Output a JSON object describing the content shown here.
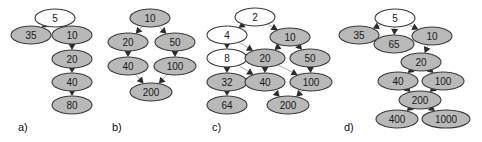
{
  "figure": {
    "width": 482,
    "height": 142,
    "background_color": "#ffffff",
    "node_fill_color": "#b9b9b9",
    "node_empty_color": "#ffffff",
    "node_stroke_color": "#3a3a3a",
    "edge_color": "#b0b0b0",
    "arrow_color": "#2b2b2b"
  },
  "panels": [
    {
      "id": "a",
      "label": "a)",
      "label_x": 18,
      "label_y": 131,
      "nodes": [
        {
          "id": "a5",
          "text": "5",
          "x": 55,
          "y": 18,
          "rx": 20,
          "ry": 9,
          "fill": "empty"
        },
        {
          "id": "a35",
          "text": "35",
          "x": 31,
          "y": 35,
          "rx": 20,
          "ry": 9,
          "fill": "filled"
        },
        {
          "id": "a10",
          "text": "10",
          "x": 72,
          "y": 35,
          "rx": 20,
          "ry": 9,
          "fill": "filled"
        },
        {
          "id": "a20",
          "text": "20",
          "x": 72,
          "y": 59,
          "rx": 20,
          "ry": 9,
          "fill": "filled"
        },
        {
          "id": "a40",
          "text": "40",
          "x": 72,
          "y": 82,
          "rx": 20,
          "ry": 9,
          "fill": "filled"
        },
        {
          "id": "a80",
          "text": "80",
          "x": 72,
          "y": 105,
          "rx": 20,
          "ry": 9,
          "fill": "filled"
        }
      ],
      "edges": [
        {
          "from": "a5",
          "to": "a35"
        },
        {
          "from": "a5",
          "to": "a10"
        },
        {
          "from": "a10",
          "to": "a20"
        },
        {
          "from": "a20",
          "to": "a40"
        },
        {
          "from": "a40",
          "to": "a80"
        }
      ]
    },
    {
      "id": "b",
      "label": "b)",
      "label_x": 112,
      "label_y": 131,
      "nodes": [
        {
          "id": "b10",
          "text": "10",
          "x": 150,
          "y": 18,
          "rx": 20,
          "ry": 9,
          "fill": "filled"
        },
        {
          "id": "b20",
          "text": "20",
          "x": 128,
          "y": 42,
          "rx": 20,
          "ry": 9,
          "fill": "filled"
        },
        {
          "id": "b50",
          "text": "50",
          "x": 175,
          "y": 42,
          "rx": 20,
          "ry": 9,
          "fill": "filled"
        },
        {
          "id": "b40",
          "text": "40",
          "x": 128,
          "y": 66,
          "rx": 20,
          "ry": 9,
          "fill": "filled"
        },
        {
          "id": "b100",
          "text": "100",
          "x": 175,
          "y": 66,
          "rx": 21,
          "ry": 9,
          "fill": "filled"
        },
        {
          "id": "b200",
          "text": "200",
          "x": 151,
          "y": 92,
          "rx": 21,
          "ry": 9,
          "fill": "filled"
        }
      ],
      "edges": [
        {
          "from": "b10",
          "to": "b20"
        },
        {
          "from": "b10",
          "to": "b50"
        },
        {
          "from": "b20",
          "to": "b40"
        },
        {
          "from": "b50",
          "to": "b100"
        },
        {
          "from": "b40",
          "to": "b200"
        },
        {
          "from": "b100",
          "to": "b200"
        }
      ]
    },
    {
      "id": "c",
      "label": "c)",
      "label_x": 212,
      "label_y": 131,
      "nodes": [
        {
          "id": "c2",
          "text": "2",
          "x": 255,
          "y": 17,
          "rx": 20,
          "ry": 9,
          "fill": "empty"
        },
        {
          "id": "c4",
          "text": "4",
          "x": 227,
          "y": 35,
          "rx": 20,
          "ry": 9,
          "fill": "empty"
        },
        {
          "id": "c10",
          "text": "10",
          "x": 290,
          "y": 37,
          "rx": 20,
          "ry": 9,
          "fill": "filled"
        },
        {
          "id": "c8",
          "text": "8",
          "x": 227,
          "y": 58,
          "rx": 20,
          "ry": 9,
          "fill": "empty"
        },
        {
          "id": "c20",
          "text": "20",
          "x": 265,
          "y": 58,
          "rx": 20,
          "ry": 9,
          "fill": "filled"
        },
        {
          "id": "c50",
          "text": "50",
          "x": 310,
          "y": 58,
          "rx": 20,
          "ry": 9,
          "fill": "filled"
        },
        {
          "id": "c32",
          "text": "32",
          "x": 227,
          "y": 82,
          "rx": 20,
          "ry": 9,
          "fill": "filled"
        },
        {
          "id": "c40",
          "text": "40",
          "x": 265,
          "y": 82,
          "rx": 20,
          "ry": 9,
          "fill": "filled"
        },
        {
          "id": "c100",
          "text": "100",
          "x": 311,
          "y": 82,
          "rx": 21,
          "ry": 9,
          "fill": "filled"
        },
        {
          "id": "c64",
          "text": "64",
          "x": 227,
          "y": 105,
          "rx": 20,
          "ry": 9,
          "fill": "filled"
        },
        {
          "id": "c200",
          "text": "200",
          "x": 288,
          "y": 105,
          "rx": 21,
          "ry": 9,
          "fill": "filled"
        }
      ],
      "edges": [
        {
          "from": "c2",
          "to": "c4"
        },
        {
          "from": "c2",
          "to": "c10"
        },
        {
          "from": "c4",
          "to": "c8"
        },
        {
          "from": "c4",
          "to": "c20"
        },
        {
          "from": "c10",
          "to": "c20"
        },
        {
          "from": "c10",
          "to": "c50"
        },
        {
          "from": "c8",
          "to": "c32"
        },
        {
          "from": "c8",
          "to": "c40"
        },
        {
          "from": "c20",
          "to": "c40"
        },
        {
          "from": "c20",
          "to": "c100"
        },
        {
          "from": "c50",
          "to": "c100"
        },
        {
          "from": "c32",
          "to": "c64"
        },
        {
          "from": "c40",
          "to": "c200"
        },
        {
          "from": "c100",
          "to": "c200"
        }
      ]
    },
    {
      "id": "d",
      "label": "d)",
      "label_x": 344,
      "label_y": 131,
      "nodes": [
        {
          "id": "d5",
          "text": "5",
          "x": 395,
          "y": 18,
          "rx": 20,
          "ry": 9,
          "fill": "empty"
        },
        {
          "id": "d35",
          "text": "35",
          "x": 359,
          "y": 35,
          "rx": 20,
          "ry": 9,
          "fill": "filled"
        },
        {
          "id": "d65",
          "text": "65",
          "x": 394,
          "y": 44,
          "rx": 20,
          "ry": 9,
          "fill": "filled"
        },
        {
          "id": "d10",
          "text": "10",
          "x": 432,
          "y": 36,
          "rx": 20,
          "ry": 9,
          "fill": "filled"
        },
        {
          "id": "d20",
          "text": "20",
          "x": 421,
          "y": 62,
          "rx": 20,
          "ry": 9,
          "fill": "filled"
        },
        {
          "id": "d40",
          "text": "40",
          "x": 398,
          "y": 81,
          "rx": 20,
          "ry": 9,
          "fill": "filled"
        },
        {
          "id": "d100",
          "text": "100",
          "x": 443,
          "y": 81,
          "rx": 21,
          "ry": 9,
          "fill": "filled"
        },
        {
          "id": "d200",
          "text": "200",
          "x": 420,
          "y": 100,
          "rx": 21,
          "ry": 9,
          "fill": "filled"
        },
        {
          "id": "d400",
          "text": "400",
          "x": 397,
          "y": 119,
          "rx": 21,
          "ry": 9,
          "fill": "filled"
        },
        {
          "id": "d1000",
          "text": "1000",
          "x": 446,
          "y": 119,
          "rx": 24,
          "ry": 9,
          "fill": "filled"
        }
      ],
      "edges": [
        {
          "from": "d5",
          "to": "d35"
        },
        {
          "from": "d5",
          "to": "d65"
        },
        {
          "from": "d5",
          "to": "d10"
        },
        {
          "from": "d10",
          "to": "d20"
        },
        {
          "from": "d20",
          "to": "d40"
        },
        {
          "from": "d20",
          "to": "d100"
        },
        {
          "from": "d40",
          "to": "d200"
        },
        {
          "from": "d100",
          "to": "d200"
        },
        {
          "from": "d200",
          "to": "d400"
        },
        {
          "from": "d200",
          "to": "d1000"
        }
      ]
    }
  ]
}
